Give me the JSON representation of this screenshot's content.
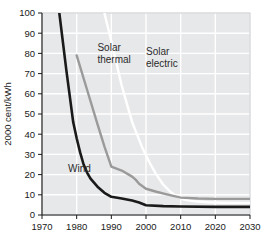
{
  "chart_data": {
    "type": "line",
    "title": "",
    "subtitle": "",
    "xlabel": "",
    "ylabel": "2000 cent/kWh",
    "xlim": [
      1970,
      2030
    ],
    "ylim": [
      0,
      100
    ],
    "grid": true,
    "legend_position": "inline-annotations",
    "x_ticks": [
      "1970",
      "1980",
      "1990",
      "2000",
      "2010",
      "2020",
      "2030"
    ],
    "y_ticks": [
      "0",
      "10",
      "20",
      "30",
      "40",
      "50",
      "60",
      "70",
      "80",
      "90",
      "100"
    ],
    "series": [
      {
        "name": "Wind",
        "color": "#1a1a1a",
        "label": "Wind",
        "x": [
          1975,
          1977,
          1979,
          1980,
          1981,
          1982,
          1983,
          1984,
          1986,
          1988,
          1990,
          1993,
          1996,
          1998,
          2000,
          2005,
          2010,
          2020,
          2030
        ],
        "values": [
          100,
          72,
          46,
          38,
          31,
          25,
          21,
          18,
          14,
          11,
          9,
          8.2,
          7.2,
          6.2,
          4.8,
          4.4,
          4.2,
          4.0,
          4.0
        ]
      },
      {
        "name": "Solar thermal",
        "color": "#9a9a9a",
        "label": "Solar\nthermal",
        "x": [
          1980,
          1983,
          1986,
          1988,
          1990,
          1993,
          1996,
          1997,
          1998,
          2000,
          2003,
          2006,
          2010,
          2015,
          2020,
          2030
        ],
        "values": [
          79,
          62,
          45,
          34,
          24,
          22,
          19,
          17.5,
          15.5,
          13,
          11.5,
          10.2,
          8.6,
          8.2,
          8.0,
          8.0
        ]
      },
      {
        "name": "Solar electric",
        "color": "#ffffff",
        "label": "Solar\nelectric",
        "x": [
          1988,
          1990,
          1993,
          1996,
          1999,
          2001,
          2003,
          2005,
          2007,
          2009,
          2011,
          2014,
          2018,
          2022,
          2026,
          2030
        ],
        "values": [
          100,
          86,
          64,
          46,
          33,
          26,
          20,
          15,
          11.5,
          9,
          7.6,
          6.8,
          6.3,
          6.1,
          6.0,
          6.0
        ]
      }
    ],
    "annotations": [
      {
        "name": "wind-label",
        "text": "Wind",
        "x": 1977.5,
        "y": 21.5
      },
      {
        "name": "solar-thermal-label",
        "line1": "Solar",
        "line2": "thermal",
        "x": 1986,
        "y": 81
      },
      {
        "name": "solar-electric-label",
        "line1": "Solar",
        "line2": "electric",
        "x": 2000,
        "y": 79
      }
    ],
    "colors": {
      "plot_background": "#e7e8ea",
      "gridline": "#ffffff",
      "axis": "#1a1a1a",
      "page_background": "#ffffff"
    }
  }
}
